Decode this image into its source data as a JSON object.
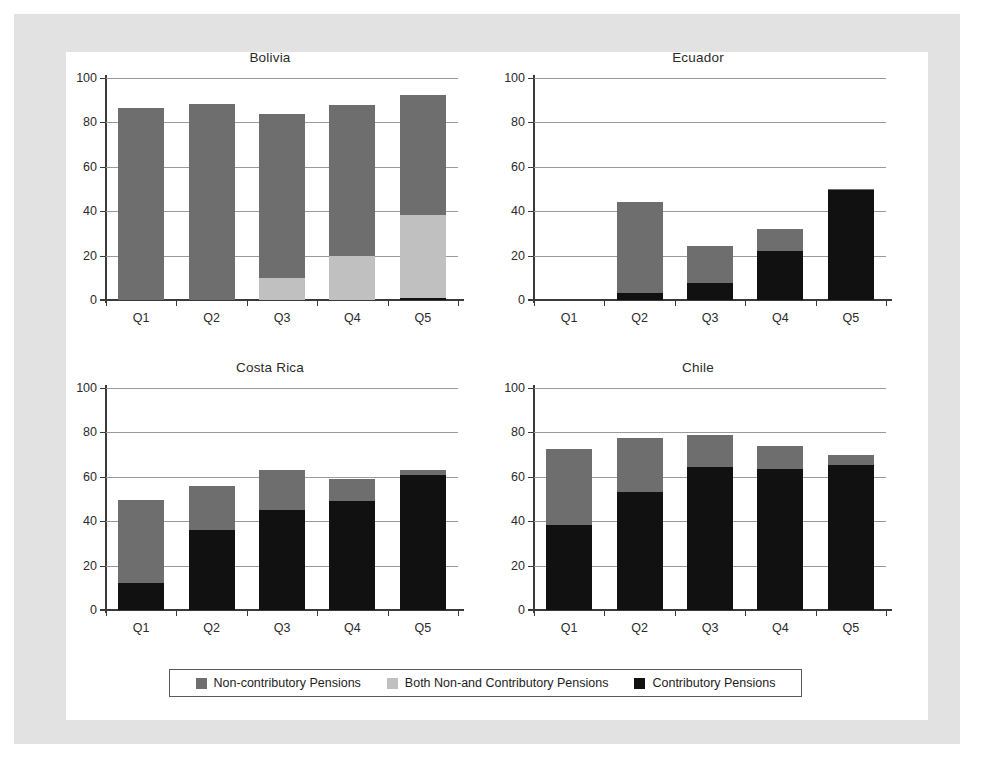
{
  "colors": {
    "non_contributory": "#6e6e6e",
    "both": "#c0c0c0",
    "contributory": "#111111",
    "grid": "#9a9a9a",
    "axis": "#3a3a3a",
    "frame": "#e2e2e2",
    "page_background": "#ffffff"
  },
  "legend": {
    "items": [
      {
        "label": "Non-contributory Pensions",
        "color": "#6e6e6e",
        "key": "non_contributory"
      },
      {
        "label": "Both Non-and Contributory Pensions",
        "color": "#c0c0c0",
        "key": "both"
      },
      {
        "label": "Contributory Pensions",
        "color": "#111111",
        "key": "contributory"
      }
    ]
  },
  "axis": {
    "yticks": [
      0,
      20,
      40,
      60,
      80,
      100
    ],
    "ylim": [
      0,
      100
    ],
    "categories": [
      "Q1",
      "Q2",
      "Q3",
      "Q4",
      "Q5"
    ]
  },
  "chart_data": [
    {
      "type": "bar",
      "title": "Bolivia",
      "xlabel": "",
      "ylabel": "",
      "ylim": [
        0,
        100
      ],
      "yticks": [
        0,
        20,
        40,
        60,
        80,
        100
      ],
      "grid": true,
      "stacked": true,
      "legend_position": "bottom",
      "categories": [
        "Q1",
        "Q2",
        "Q3",
        "Q4",
        "Q5"
      ],
      "series": [
        {
          "name": "Contributory Pensions",
          "color": "#111111",
          "values": [
            0,
            0,
            0,
            0,
            1
          ]
        },
        {
          "name": "Both Non-and Contributory Pensions",
          "color": "#c0c0c0",
          "values": [
            0,
            0,
            10,
            20,
            37.5
          ]
        },
        {
          "name": "Non-contributory Pensions",
          "color": "#6e6e6e",
          "values": [
            86.5,
            88.5,
            74,
            68,
            54
          ]
        }
      ],
      "totals": [
        86.5,
        88.5,
        84,
        88,
        92.5
      ]
    },
    {
      "type": "bar",
      "title": "Ecuador",
      "xlabel": "",
      "ylabel": "",
      "ylim": [
        0,
        100
      ],
      "yticks": [
        0,
        20,
        40,
        60,
        80,
        100
      ],
      "grid": true,
      "stacked": true,
      "legend_position": "bottom",
      "categories": [
        "Q1",
        "Q2",
        "Q3",
        "Q4",
        "Q5"
      ],
      "series": [
        {
          "name": "Contributory Pensions",
          "color": "#111111",
          "values": [
            0,
            3,
            7.5,
            22,
            49.5
          ]
        },
        {
          "name": "Both Non-and Contributory Pensions",
          "color": "#c0c0c0",
          "values": [
            0,
            0,
            0,
            0,
            0
          ]
        },
        {
          "name": "Non-contributory Pensions",
          "color": "#6e6e6e",
          "values": [
            0,
            41,
            17,
            10,
            0.5
          ]
        }
      ],
      "totals": [
        0,
        44,
        24.5,
        32,
        50
      ]
    },
    {
      "type": "bar",
      "title": "Costa Rica",
      "xlabel": "",
      "ylabel": "",
      "ylim": [
        0,
        100
      ],
      "yticks": [
        0,
        20,
        40,
        60,
        80,
        100
      ],
      "grid": true,
      "stacked": true,
      "legend_position": "bottom",
      "categories": [
        "Q1",
        "Q2",
        "Q3",
        "Q4",
        "Q5"
      ],
      "series": [
        {
          "name": "Contributory Pensions",
          "color": "#111111",
          "values": [
            12,
            36,
            45,
            49,
            61
          ]
        },
        {
          "name": "Both Non-and Contributory Pensions",
          "color": "#c0c0c0",
          "values": [
            0,
            0,
            0,
            0,
            0
          ]
        },
        {
          "name": "Non-contributory Pensions",
          "color": "#6e6e6e",
          "values": [
            37.5,
            20,
            18,
            10,
            2
          ]
        }
      ],
      "totals": [
        49.5,
        56,
        63,
        59,
        63
      ]
    },
    {
      "type": "bar",
      "title": "Chile",
      "xlabel": "",
      "ylabel": "",
      "ylim": [
        0,
        100
      ],
      "yticks": [
        0,
        20,
        40,
        60,
        80,
        100
      ],
      "grid": true,
      "stacked": true,
      "legend_position": "bottom",
      "categories": [
        "Q1",
        "Q2",
        "Q3",
        "Q4",
        "Q5"
      ],
      "series": [
        {
          "name": "Contributory Pensions",
          "color": "#111111",
          "values": [
            38.5,
            53,
            64.5,
            63.5,
            65.5
          ]
        },
        {
          "name": "Both Non-and Contributory Pensions",
          "color": "#c0c0c0",
          "values": [
            0,
            0,
            0,
            0,
            0
          ]
        },
        {
          "name": "Non-contributory Pensions",
          "color": "#6e6e6e",
          "values": [
            34,
            24.5,
            14.5,
            10.5,
            4.5
          ]
        }
      ],
      "totals": [
        72.5,
        77.5,
        79,
        74,
        70
      ]
    }
  ]
}
